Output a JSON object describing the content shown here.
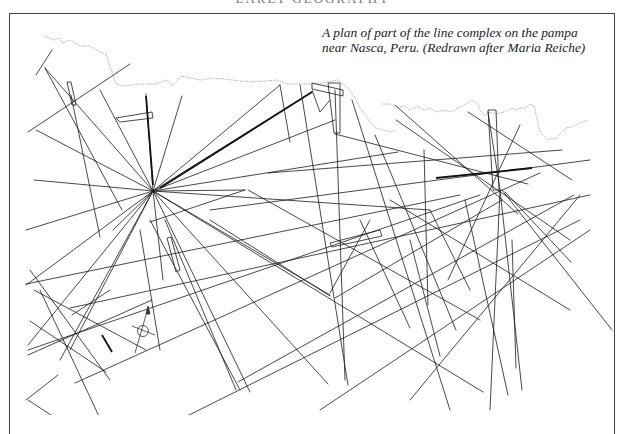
{
  "header": {
    "running_title": "EARLY GEOGRAPHY"
  },
  "figure": {
    "caption_line1": "A plan of part of the line complex on the pampa",
    "caption_line2": "near Nasca, Peru. (Redrawn after Maria Reiche)",
    "line_color": "#1a1a1a",
    "coastline_color": "#999999",
    "frame_color": "#444444"
  },
  "compass": {
    "label": "N"
  }
}
